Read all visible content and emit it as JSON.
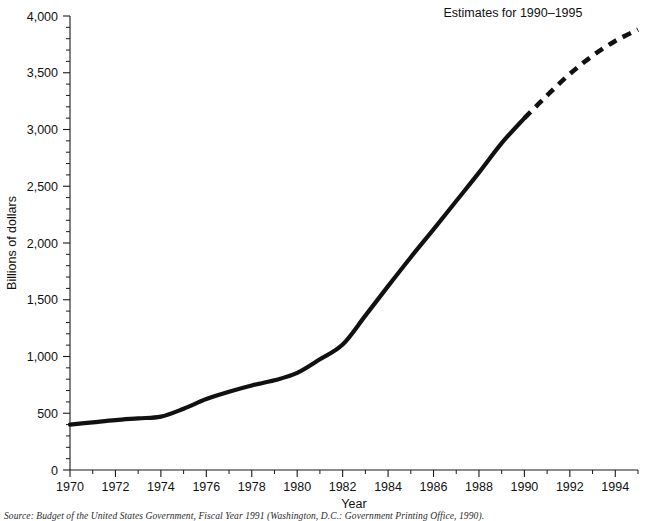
{
  "chart_data": {
    "type": "line",
    "title": "",
    "xlabel": "Year",
    "ylabel": "Billions of dollars",
    "xlim": [
      1970,
      1995
    ],
    "ylim": [
      0,
      4000
    ],
    "grid": false,
    "legend_position": "none",
    "annotations": [
      {
        "name": "estimates-note",
        "text": "Estimates for 1990–1995",
        "x": 1991.0,
        "y": 3950
      }
    ],
    "x_tick_labels": [
      "1970",
      "1972",
      "1974",
      "1976",
      "1978",
      "1980",
      "1982",
      "1984",
      "1986",
      "1988",
      "1990",
      "1992",
      "1994"
    ],
    "x_ticks": [
      1970,
      1972,
      1974,
      1976,
      1978,
      1980,
      1982,
      1984,
      1986,
      1988,
      1990,
      1992,
      1994
    ],
    "x_minor_ticks": [
      1971,
      1973,
      1975,
      1977,
      1979,
      1981,
      1983,
      1985,
      1987,
      1989,
      1991,
      1993,
      1995
    ],
    "y_tick_labels": [
      "0",
      "500",
      "1,000",
      "1,500",
      "2,000",
      "2,500",
      "3,000",
      "3,500",
      "4,000"
    ],
    "y_ticks": [
      0,
      500,
      1000,
      1500,
      2000,
      2500,
      3000,
      3500,
      4000
    ],
    "y_minor_step": 100,
    "series": [
      {
        "name": "Actual outlays",
        "style": "solid",
        "color": "#111111",
        "x": [
          1970,
          1971,
          1972,
          1973,
          1974,
          1975,
          1976,
          1977,
          1978,
          1979,
          1980,
          1981,
          1982,
          1983,
          1984,
          1985,
          1986,
          1987,
          1988,
          1989,
          1990
        ],
        "values": [
          400,
          420,
          440,
          455,
          470,
          540,
          625,
          690,
          745,
          790,
          855,
          975,
          1105,
          1360,
          1620,
          1875,
          2120,
          2370,
          2620,
          2880,
          3100
        ]
      },
      {
        "name": "Estimates 1990–1995",
        "style": "dashed",
        "color": "#111111",
        "x": [
          1990,
          1991,
          1992,
          1993,
          1994,
          1995
        ],
        "values": [
          3100,
          3300,
          3490,
          3650,
          3780,
          3880
        ]
      }
    ]
  },
  "source": {
    "label": "Source:",
    "text": "Source: Budget of the United States Government, Fiscal Year 1991 (Washington, D.C.: Government Printing Office, 1990)."
  }
}
